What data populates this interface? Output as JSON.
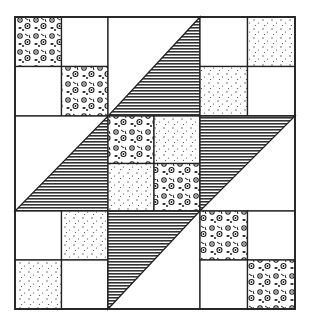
{
  "diagram": {
    "type": "quilt-block",
    "grid": {
      "units": 3,
      "cells_per_unit": 2
    },
    "colors": {
      "line": "#222222",
      "background": "#ffffff",
      "stripe": "#333333",
      "dot": "#444444",
      "floral": "#1e1e1e"
    },
    "units": [
      {
        "row": 0,
        "col": 0,
        "kind": "four-patch",
        "cells": [
          "floral",
          "white",
          "white",
          "floral"
        ]
      },
      {
        "row": 0,
        "col": 1,
        "kind": "half-square-triangle",
        "shaded": "lower-right"
      },
      {
        "row": 0,
        "col": 2,
        "kind": "four-patch",
        "cells": [
          "white",
          "dotted",
          "dotted",
          "white"
        ]
      },
      {
        "row": 1,
        "col": 0,
        "kind": "half-square-triangle",
        "shaded": "lower-right"
      },
      {
        "row": 1,
        "col": 1,
        "kind": "four-patch",
        "cells": [
          "floral",
          "dotted",
          "dotted",
          "floral"
        ]
      },
      {
        "row": 1,
        "col": 2,
        "kind": "half-square-triangle",
        "shaded": "upper-left"
      },
      {
        "row": 2,
        "col": 0,
        "kind": "four-patch",
        "cells": [
          "white",
          "dotted",
          "dotted",
          "white"
        ]
      },
      {
        "row": 2,
        "col": 1,
        "kind": "half-square-triangle",
        "shaded": "upper-left"
      },
      {
        "row": 2,
        "col": 2,
        "kind": "four-patch",
        "cells": [
          "floral",
          "white",
          "white",
          "floral"
        ]
      }
    ]
  }
}
